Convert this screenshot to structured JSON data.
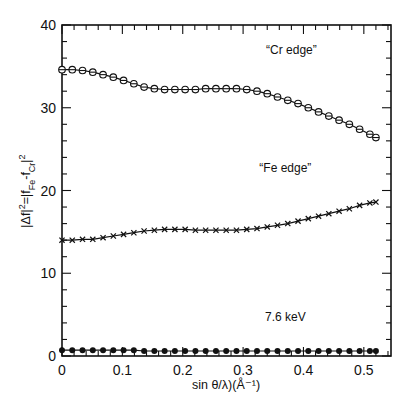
{
  "chart_data": {
    "type": "line",
    "title": "",
    "xlabel": "sin θ/λ)(Å⁻¹)",
    "ylabel": "|Δf|²=|f_Fe-f_Cr|²",
    "xlim": [
      0,
      0.545
    ],
    "ylim": [
      0,
      40
    ],
    "xticks": [
      0,
      0.1,
      0.2,
      0.3,
      0.4,
      0.5
    ],
    "xtick_labels": [
      "0",
      "0.1",
      "0.2",
      "0.3",
      "0.4",
      "0.5"
    ],
    "yticks": [
      0,
      10,
      20,
      30,
      40
    ],
    "ytick_labels": [
      "0",
      "10",
      "20",
      "30",
      "40"
    ],
    "grid": false,
    "legend": "none (inline annotations)",
    "x": [
      0.0,
      0.017,
      0.034,
      0.051,
      0.068,
      0.085,
      0.102,
      0.119,
      0.136,
      0.153,
      0.17,
      0.187,
      0.204,
      0.221,
      0.238,
      0.255,
      0.272,
      0.289,
      0.306,
      0.323,
      0.34,
      0.357,
      0.374,
      0.391,
      0.408,
      0.425,
      0.442,
      0.459,
      0.476,
      0.493,
      0.51,
      0.52
    ],
    "series": [
      {
        "name": "“Cr edge”",
        "marker": "open-circle",
        "values": [
          34.6,
          34.6,
          34.5,
          34.3,
          34.0,
          33.7,
          33.3,
          32.9,
          32.5,
          32.3,
          32.2,
          32.2,
          32.2,
          32.2,
          32.3,
          32.3,
          32.3,
          32.3,
          32.2,
          32.0,
          31.7,
          31.3,
          30.9,
          30.5,
          30.0,
          29.5,
          29.0,
          28.5,
          28.0,
          27.4,
          26.8,
          26.4
        ]
      },
      {
        "name": "“Fe edge”",
        "marker": "x",
        "values": [
          14.0,
          14.0,
          14.1,
          14.1,
          14.3,
          14.5,
          14.7,
          14.9,
          15.1,
          15.2,
          15.3,
          15.3,
          15.3,
          15.2,
          15.2,
          15.2,
          15.2,
          15.2,
          15.3,
          15.4,
          15.6,
          15.8,
          16.0,
          16.3,
          16.6,
          16.9,
          17.2,
          17.5,
          17.8,
          18.2,
          18.5,
          18.6
        ]
      },
      {
        "name": "7.6 keV",
        "marker": "filled-circle",
        "values": [
          0.7,
          0.7,
          0.7,
          0.7,
          0.7,
          0.7,
          0.7,
          0.7,
          0.6,
          0.6,
          0.6,
          0.6,
          0.6,
          0.6,
          0.6,
          0.6,
          0.6,
          0.6,
          0.6,
          0.6,
          0.6,
          0.6,
          0.6,
          0.6,
          0.6,
          0.6,
          0.6,
          0.6,
          0.6,
          0.6,
          0.6,
          0.6
        ]
      }
    ],
    "annotations": [
      {
        "text": "“Cr edge”",
        "x": 0.38,
        "y": 36.5
      },
      {
        "text": "“Fe edge”",
        "x": 0.37,
        "y": 22.2
      },
      {
        "text": "7.6 keV",
        "x": 0.37,
        "y": 4.2
      }
    ]
  }
}
